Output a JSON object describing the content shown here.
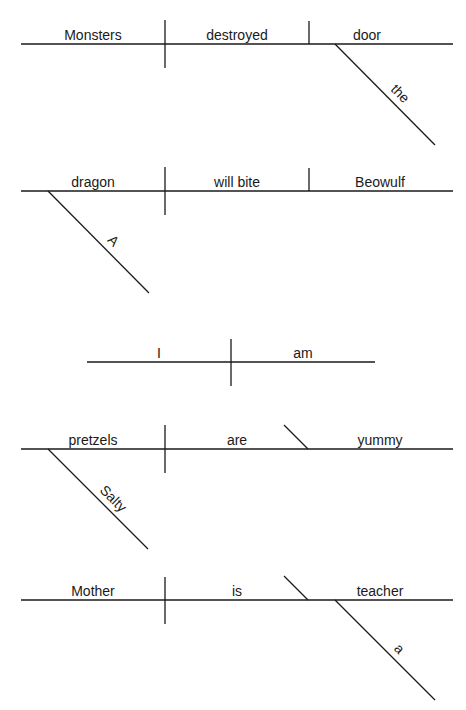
{
  "diagrams": [
    {
      "sentence": "Monsters destroyed the door",
      "subject": "Monsters",
      "verb": "destroyed",
      "object": "door",
      "modifier": "the"
    },
    {
      "sentence": "A dragon will bite Beowulf",
      "subject": "dragon",
      "verb": "will bite",
      "object": "Beowulf",
      "modifier": "A"
    },
    {
      "sentence": "I am",
      "subject": "I",
      "verb": "am"
    },
    {
      "sentence": "Salty pretzels are yummy",
      "subject": "pretzels",
      "verb": "are",
      "complement": "yummy",
      "modifier": "Salty"
    },
    {
      "sentence": "Mother is a teacher",
      "subject": "Mother",
      "verb": "is",
      "complement": "teacher",
      "modifier": "a"
    }
  ]
}
